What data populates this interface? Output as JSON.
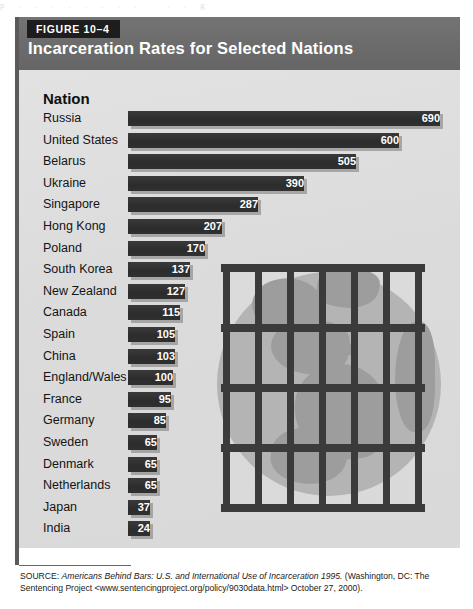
{
  "scan_remnant": "p  .  .  .  .  .  .  .  .  .  .  .  g",
  "figure": {
    "tag": "FIGURE 10–4",
    "title": "Incarceration Rates for Selected Nations",
    "column_heading": "Nation"
  },
  "artwork": {
    "name": "jail-bars-over-globe",
    "vertical_bar_count": 7,
    "horizontal_bar_count": 5,
    "globe_color": "#b4b4b4",
    "continent_color": "#9d9d9d",
    "bar_color": "#3b3b3b"
  },
  "colors": {
    "header_band": "#6e6e6e",
    "figure_tag_bg": "#1d1d1d",
    "body_bg": "#dedede",
    "bar_fill": "#2f2f2f",
    "bar_shadow": "#787878",
    "text": "#141414"
  },
  "source": {
    "label": "SOURCE:",
    "title": "Americans Behind Bars: U.S. and International Use of Incarceration 1995.",
    "rest": "(Washington, DC: The Sentencing Project <www.sentencingproject.org/policy/9030data.html> October 27, 2000)."
  },
  "chart_data": {
    "type": "bar",
    "orientation": "horizontal",
    "title": "Incarceration Rates for Selected Nations",
    "xlabel": "",
    "ylabel": "Nation",
    "xlim": [
      0,
      690
    ],
    "grid": false,
    "legend": "none",
    "categories": [
      "Russia",
      "United States",
      "Belarus",
      "Ukraine",
      "Singapore",
      "Hong Kong",
      "Poland",
      "South Korea",
      "New Zealand",
      "Canada",
      "Spain",
      "China",
      "England/Wales",
      "France",
      "Germany",
      "Sweden",
      "Denmark",
      "Netherlands",
      "Japan",
      "India"
    ],
    "values": [
      690,
      600,
      505,
      390,
      287,
      207,
      170,
      137,
      127,
      115,
      105,
      103,
      100,
      95,
      85,
      65,
      65,
      65,
      37,
      24
    ]
  }
}
